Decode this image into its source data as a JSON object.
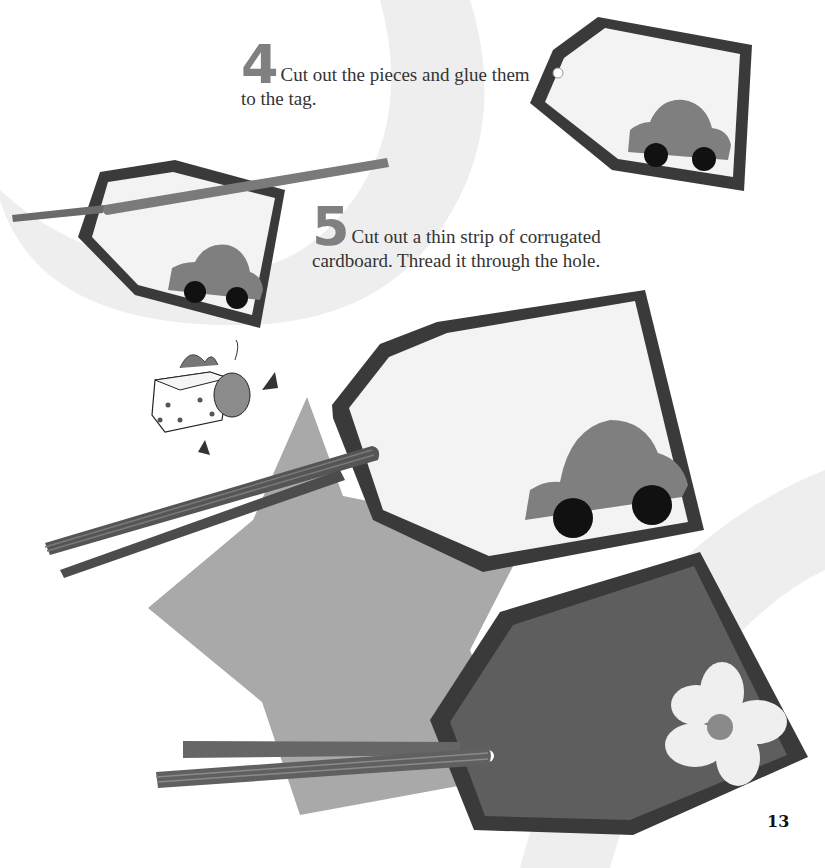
{
  "steps": [
    {
      "number": "4",
      "text": "Cut out the pieces and glue them to the tag."
    },
    {
      "number": "5",
      "text": "Cut out a thin strip of corrugated cardboard. Thread it through the hole."
    }
  ],
  "page_number": "13",
  "illustrations": {
    "tag_step4": "gift-tag with car cutout",
    "tag_step5": "gift-tag with car cutout and cardboard strip",
    "gift_character": "cartoon gift-box character",
    "tag_car_large": "finished tag with car and corrugated strip",
    "tag_flower_large": "finished tag with flower and corrugated strip",
    "star": "large paper star background"
  },
  "colors": {
    "page_bg": "#ffffff",
    "background_arc": "#eeeeee",
    "tag_border": "#3a3a3a",
    "tag_light": "#f3f3f3",
    "tag_dark": "#5e5e5e",
    "car": "#7f7f7f",
    "wheel": "#111111",
    "star": "#a9a9a9",
    "strip": "#555555",
    "flower": "#efefef",
    "flower_center": "#8a8a8a",
    "step_number": "#808080",
    "body_text": "#333333"
  }
}
